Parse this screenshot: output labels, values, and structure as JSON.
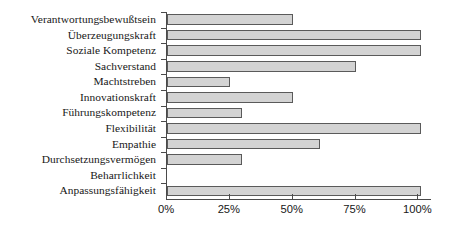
{
  "chart_data": {
    "type": "bar",
    "orientation": "horizontal",
    "title": "",
    "xlabel": "",
    "ylabel": "",
    "xlim": [
      0,
      105
    ],
    "grid": false,
    "legend": null,
    "xtick_labels": [
      "0%",
      "25%",
      "50%",
      "75%",
      "100%"
    ],
    "xtick_values": [
      0,
      25,
      50,
      75,
      100
    ],
    "categories": [
      "Verantwortungsbewußtsein",
      "Überzeugungskraft",
      "Soziale Kompetenz",
      "Sachverstand",
      "Machtstreben",
      "Innovationskraft",
      "Führungskompetenz",
      "Flexibilität",
      "Empathie",
      "Durchsetzungsvermögen",
      "Beharrlichkeit",
      "Anpassungsfähigkeit"
    ],
    "values": [
      50,
      101,
      101,
      75,
      25,
      50,
      30,
      101,
      61,
      30,
      0,
      101
    ],
    "bar_fill_color": "#d3d3d3",
    "bar_border_color": "#5a5a5a",
    "axis_color": "#4a4a4a"
  }
}
